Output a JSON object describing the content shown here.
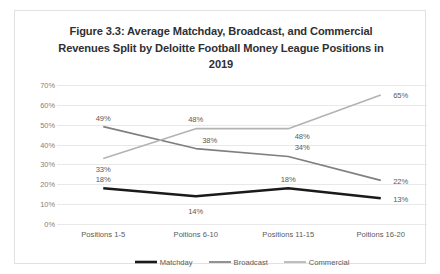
{
  "chart_data": {
    "type": "line",
    "title": "Figure 3.3: Average Matchday, Broadcast, and Commercial Revenues Split by Deloitte Football Money League Positions in 2019",
    "xlabel": "",
    "ylabel": "",
    "ylim": [
      0,
      70
    ],
    "grid": true,
    "legend_position": "bottom",
    "categories": [
      "Positions 1-5",
      "Poitions 6-10",
      "Positions 11-15",
      "Poitions 16-20"
    ],
    "ytick_labels": [
      "0%",
      "10%",
      "20%",
      "30%",
      "40%",
      "50%",
      "60%",
      "70%"
    ],
    "ytick_values": [
      0,
      10,
      20,
      30,
      40,
      50,
      60,
      70
    ],
    "series": [
      {
        "name": "Matchday",
        "color": "#1a1a1a",
        "width": 2.6,
        "values": [
          18,
          14,
          18,
          13
        ],
        "labels": [
          "18%",
          "14%",
          "18%",
          "13%"
        ]
      },
      {
        "name": "Broadcast",
        "color": "#7f7f7f",
        "width": 1.7,
        "values": [
          49,
          38,
          34,
          22
        ],
        "labels": [
          "49%",
          "38%",
          "34%",
          "22%"
        ]
      },
      {
        "name": "Commercial",
        "color": "#b3b3b3",
        "width": 1.7,
        "values": [
          33,
          48,
          48,
          65
        ],
        "labels": [
          "33%",
          "48%",
          "48%",
          "65%"
        ]
      }
    ]
  },
  "legend": {
    "items": [
      {
        "label": "Matchday"
      },
      {
        "label": "Broadcast"
      },
      {
        "label": "Commercial"
      }
    ]
  },
  "colors": {
    "matchday": "#1a1a1a",
    "broadcast": "#7f7f7f",
    "commercial": "#b3b3b3",
    "gridline": "#e8e8e8",
    "border": "#e2e2e2",
    "title_text": "#2e3033",
    "axis_text": "#5a5a5a",
    "ytick_text": "#808080"
  }
}
